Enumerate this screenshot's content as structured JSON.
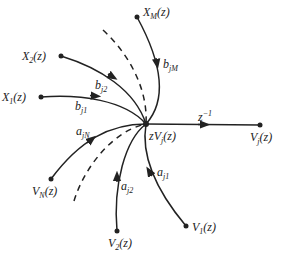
{
  "diagram": {
    "type": "signal-flow-graph",
    "hub": {
      "label_prefix": "zV",
      "label_sub": "j",
      "label_suffix": "(z)"
    },
    "output_edge": {
      "gain_base": "z",
      "gain_exp": "−1"
    },
    "output_node": {
      "base": "V",
      "sub": "j",
      "suffix": "(z)"
    },
    "input_nodes": [
      {
        "id": "X1",
        "base": "X",
        "sub": "1",
        "suffix": "(z)",
        "gain_base": "b",
        "gain_sub": "j1"
      },
      {
        "id": "X2",
        "base": "X",
        "sub": "2",
        "suffix": "(z)",
        "gain_base": "b",
        "gain_sub": "j2"
      },
      {
        "id": "XM",
        "base": "X",
        "sub": "M",
        "suffix": "(z)",
        "gain_base": "b",
        "gain_sub": "jM"
      },
      {
        "id": "VN",
        "base": "V",
        "sub": "N",
        "suffix": "(z)",
        "gain_base": "a",
        "gain_sub": "jN"
      },
      {
        "id": "V2",
        "base": "V",
        "sub": "2",
        "suffix": "(z)",
        "gain_base": "a",
        "gain_sub": "j2"
      },
      {
        "id": "V1",
        "base": "V",
        "sub": "1",
        "suffix": "(z)",
        "gain_base": "a",
        "gain_sub": "j1"
      }
    ],
    "colors": {
      "line": "#222222",
      "background": "#ffffff"
    }
  }
}
